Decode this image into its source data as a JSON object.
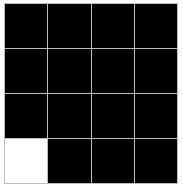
{
  "board": {
    "rows": 4,
    "cols": 4,
    "colors": {
      "off": "#000000",
      "on": "#ffffff",
      "grid_line": "#bdbdbd"
    },
    "cells": [
      [
        0,
        0,
        0,
        0
      ],
      [
        0,
        0,
        0,
        0
      ],
      [
        0,
        0,
        0,
        0
      ],
      [
        1,
        0,
        0,
        0
      ]
    ]
  }
}
